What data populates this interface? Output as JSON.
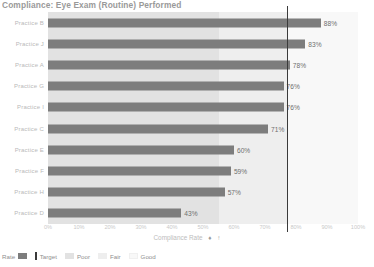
{
  "chart_data": {
    "type": "bar",
    "orientation": "horizontal",
    "title": "Compliance: Eye Exam (Routine) Performed",
    "xlabel": "Compliance Rate",
    "ylabel": "",
    "xlim": [
      0,
      100
    ],
    "xtick_labels": [
      "0%",
      "10%",
      "20%",
      "30%",
      "40%",
      "50%",
      "60%",
      "70%",
      "80%",
      "90%",
      "100%"
    ],
    "xtick_values": [
      0,
      10,
      20,
      30,
      40,
      50,
      60,
      70,
      80,
      90,
      100
    ],
    "grid": false,
    "legend_position": "bottom-left",
    "categories": [
      "Practice B",
      "Practice J",
      "Practice A",
      "Practice G",
      "Practice I",
      "Practice C",
      "Practice E",
      "Practice F",
      "Practice H",
      "Practice D"
    ],
    "values": [
      88,
      83,
      78,
      76,
      76,
      71,
      60,
      59,
      57,
      43
    ],
    "value_labels": [
      "88%",
      "83%",
      "78%",
      "76%",
      "76%",
      "71%",
      "60%",
      "59%",
      "57%",
      "43%"
    ],
    "series": [
      {
        "name": "Rate",
        "values": [
          88,
          83,
          78,
          76,
          76,
          71,
          60,
          59,
          57,
          43
        ]
      }
    ],
    "target": {
      "label": "Target",
      "value": 77
    },
    "bands": [
      {
        "name": "Poor",
        "from": 0,
        "to": 55,
        "color": "#e2e2e2"
      },
      {
        "name": "Fair",
        "from": 55,
        "to": 77,
        "color": "#eeeeee"
      },
      {
        "name": "Good",
        "from": 77,
        "to": 100,
        "color": "#f8f8f8"
      }
    ],
    "colors": {
      "bar": "#7d7d7d",
      "target_line": "#3a3a3a",
      "poor": "#e2e2e2",
      "fair": "#eeeeee",
      "good": "#f8f8f8",
      "text": "#8f8f8f"
    }
  },
  "legend": {
    "items": [
      {
        "label": "Rate",
        "swatch": "rate"
      },
      {
        "label": "Target",
        "swatch": "target"
      },
      {
        "label": "Poor",
        "swatch": "poor"
      },
      {
        "label": "Fair",
        "swatch": "fair"
      },
      {
        "label": "Good",
        "swatch": "good"
      }
    ]
  },
  "axis_icons": {
    "sort_icon": "♦",
    "filter_icon": "↑"
  }
}
